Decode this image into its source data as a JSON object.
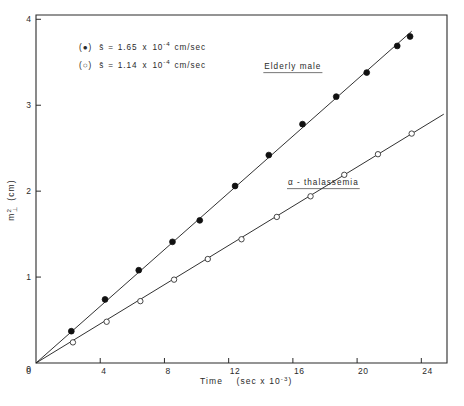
{
  "chart_data": {
    "type": "scatter",
    "title": "",
    "xlabel": "Time  (sec x 10⁻³)",
    "ylabel": "m²⊥ (cm)",
    "xlim": [
      0,
      25.6
    ],
    "ylim": [
      0,
      4.05
    ],
    "xticks": [
      0,
      4,
      8,
      12,
      16,
      20,
      24
    ],
    "xtick_labels": [
      "0",
      "4",
      "8",
      "12",
      "16",
      "20",
      "24"
    ],
    "yticks": [
      0,
      1,
      2,
      3,
      4
    ],
    "ytick_labels": [
      "0",
      "1",
      "2",
      "3",
      "4"
    ],
    "grid": false,
    "legend_position": "upper-left-inside",
    "series": [
      {
        "name": "Elderly male",
        "marker": "filled-circle",
        "slope": 0.165,
        "sedimentation_coefficient": "1.65 x 10⁻⁴ cm/sec",
        "fit_x": [
          0,
          23.4
        ],
        "fit_y": [
          0,
          3.861
        ],
        "points": [
          {
            "x": 2.2,
            "y": 0.37
          },
          {
            "x": 4.3,
            "y": 0.74
          },
          {
            "x": 6.4,
            "y": 1.08
          },
          {
            "x": 8.5,
            "y": 1.41
          },
          {
            "x": 10.2,
            "y": 1.66
          },
          {
            "x": 12.4,
            "y": 2.06
          },
          {
            "x": 14.5,
            "y": 2.42
          },
          {
            "x": 16.6,
            "y": 2.78
          },
          {
            "x": 18.7,
            "y": 3.1
          },
          {
            "x": 20.6,
            "y": 3.38
          },
          {
            "x": 22.5,
            "y": 3.69
          },
          {
            "x": 23.3,
            "y": 3.8
          }
        ]
      },
      {
        "name": "α - thalassemia",
        "marker": "open-circle",
        "slope": 0.114,
        "sedimentation_coefficient": "1.14 x 10⁻⁴ cm/sec",
        "fit_x": [
          0,
          25.4
        ],
        "fit_y": [
          0,
          2.896
        ],
        "points": [
          {
            "x": 2.3,
            "y": 0.24
          },
          {
            "x": 4.4,
            "y": 0.48
          },
          {
            "x": 6.5,
            "y": 0.72
          },
          {
            "x": 8.6,
            "y": 0.97
          },
          {
            "x": 10.7,
            "y": 1.21
          },
          {
            "x": 12.8,
            "y": 1.44
          },
          {
            "x": 15.0,
            "y": 1.7
          },
          {
            "x": 17.1,
            "y": 1.94
          },
          {
            "x": 19.2,
            "y": 2.19
          },
          {
            "x": 21.3,
            "y": 2.43
          },
          {
            "x": 23.4,
            "y": 2.67
          }
        ]
      }
    ],
    "annotations": [
      {
        "name": "elderly-male-curve-label",
        "text": "Elderly male",
        "x": 16.0,
        "y": 3.42,
        "underlined": true
      },
      {
        "name": "alpha-thalassemia-curve-label",
        "text": "α - thalassemia",
        "x": 17.9,
        "y": 2.07,
        "underlined": true
      }
    ],
    "legend": [
      {
        "marker": "filled-circle",
        "marker_open_paren": "(",
        "marker_close_paren": ")",
        "symbol": "s̄",
        "equals": "=",
        "mantissa": "1.65",
        "times": "x",
        "base": "10",
        "exponent": "-4",
        "units": "cm/sec",
        "full_text": "(●)  s̄ = 1.65 x 10⁻⁴ cm/sec"
      },
      {
        "marker": "open-circle",
        "marker_open_paren": "(",
        "marker_close_paren": ")",
        "symbol": "s̄",
        "equals": "=",
        "mantissa": "1.14",
        "times": "x",
        "base": "10",
        "exponent": "-4",
        "units": "cm/sec",
        "full_text": "(○)  s̄ = 1.14 x 10⁻⁴ cm/sec"
      }
    ],
    "xlabel_parts": {
      "name": "Time",
      "units_open": "(sec x 10",
      "units_exponent": "-3",
      "units_close": ")"
    },
    "ylabel_parts": {
      "base": "m",
      "superscript": "2",
      "subscript": "⊥",
      "units": "(cm)"
    },
    "colors": {
      "axis": "#2b2b2b",
      "line": "#1a1a1a",
      "filled_marker": "#111111",
      "open_marker_stroke": "#333333",
      "background": "#ffffff",
      "text": "#2a2a2a"
    }
  }
}
